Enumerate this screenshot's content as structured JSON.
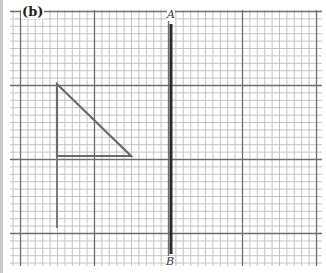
{
  "figure": {
    "part_label": "(b)",
    "grid": {
      "x0": 10,
      "y0": 10,
      "x1": 322,
      "y1": 266,
      "minor_step": 7.4,
      "major_every": 10,
      "major_x_origin": 20.5,
      "major_y_origin": 11.5,
      "minor_color": "#bdbdbd",
      "major_color": "#6e6e6e"
    },
    "mirror_line": {
      "start_label": "A",
      "end_label": "B",
      "x": 171,
      "y_top": 24,
      "y_bottom": 254,
      "color": "#2b2b2b"
    },
    "triangle": {
      "vertices": [
        [
          57,
          84
        ],
        [
          57,
          156
        ],
        [
          131,
          156
        ]
      ],
      "color": "#6a6a6a"
    },
    "extension_line": {
      "x": 57,
      "y_top": 156,
      "y_bottom": 228,
      "color": "#7a7a7a"
    }
  }
}
